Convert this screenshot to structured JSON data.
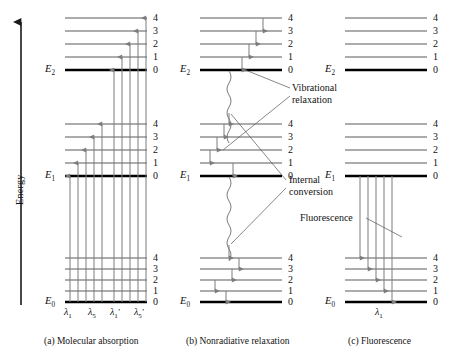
{
  "figure": {
    "type": "jablonski-energy-level-diagram",
    "axis": {
      "label": "Energy",
      "direction": "up"
    },
    "vibrational_levels": [
      "4",
      "3",
      "2",
      "1",
      "0"
    ],
    "electronic_states": [
      "E0",
      "E1",
      "E2"
    ],
    "state_labels": {
      "E0": "E",
      "E0_sub": "0",
      "E1": "E",
      "E1_sub": "1",
      "E2": "E",
      "E2_sub": "2"
    }
  },
  "panels": [
    {
      "id": "a",
      "caption": "(a) Molecular absorption",
      "process": "absorption",
      "arrow_direction": "up",
      "wavelengths": [
        {
          "sym": "λ",
          "sub": "1"
        },
        {
          "sym": "λ",
          "sub": "5"
        },
        {
          "sym": "λ",
          "sub": "1"
        },
        {
          "sym": "λ",
          "sub": "5"
        }
      ],
      "wavelength_text": [
        "λ1",
        "λ5",
        "λ1′",
        "λ5′"
      ],
      "transitions": "E0 (v=0) to E1 (v=0..4) and E0 (v=0) to E2 (v=0..4)"
    },
    {
      "id": "b",
      "caption": "(b) Nonradiative relaxation",
      "process": "nonradiative",
      "annotations": [
        {
          "name": "vibrational-relaxation",
          "line1": "Vibrational",
          "line2": "relaxation"
        },
        {
          "name": "internal-conversion",
          "line1": "Internal",
          "line2": "conversion"
        }
      ]
    },
    {
      "id": "c",
      "caption": "(c) Fluorescence",
      "process": "fluorescence",
      "annotations": [
        {
          "name": "fluorescence",
          "line1": "Fluorescence",
          "line2": ""
        }
      ],
      "wavelength_text": [
        "λ1"
      ],
      "wavelengths": [
        {
          "sym": "λ",
          "sub": "1"
        }
      ],
      "transitions": "E1 (v=0) to E0 (v=0..4)"
    }
  ],
  "colors": {
    "ink": "#1a1a1a",
    "level_thin": "#5a5a5a",
    "level_thick": "#000000",
    "arrow": "#7d7d7d",
    "leader": "#555555",
    "background": "#ffffff"
  }
}
